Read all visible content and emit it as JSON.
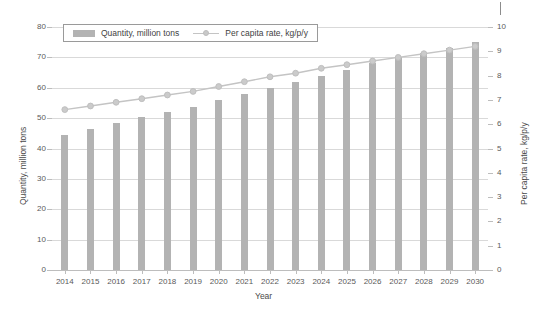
{
  "chart_data": {
    "type": "bar",
    "title": "",
    "xlabel": "Year",
    "ylabel": "Quantity, million tons",
    "y2label": "Per capita rate, kg/p/y",
    "ylim": [
      0,
      80
    ],
    "y2lim": [
      0,
      10
    ],
    "yticks": [
      0,
      10,
      20,
      30,
      40,
      50,
      60,
      70,
      80
    ],
    "y2ticks": [
      0,
      1,
      2,
      3,
      4,
      5,
      6,
      7,
      8,
      9,
      10
    ],
    "grid": true,
    "legend_position": "top-center",
    "categories": [
      "2014",
      "2015",
      "2016",
      "2017",
      "2018",
      "2019",
      "2020",
      "2021",
      "2022",
      "2023",
      "2024",
      "2025",
      "2026",
      "2027",
      "2028",
      "2029",
      "2030"
    ],
    "series": [
      {
        "name": "Quantity, million tons",
        "kind": "bar",
        "axis": "left",
        "color": "#b3b3b3",
        "values": [
          44.5,
          46.5,
          48.3,
          50.3,
          52.0,
          53.8,
          56.0,
          57.8,
          59.8,
          61.8,
          64.0,
          66.0,
          68.0,
          70.0,
          71.5,
          73.2,
          75.0
        ]
      },
      {
        "name": "Per capita rate, kg/p/y",
        "kind": "line",
        "axis": "right",
        "color": "#c4c4c4",
        "values": [
          6.6,
          6.75,
          6.9,
          7.05,
          7.2,
          7.35,
          7.55,
          7.75,
          7.95,
          8.1,
          8.3,
          8.45,
          8.6,
          8.75,
          8.9,
          9.05,
          9.2
        ]
      }
    ]
  },
  "legend": {
    "items": [
      {
        "label": "Quantity, million tons"
      },
      {
        "label": "Per capita rate, kg/p/y"
      }
    ]
  }
}
